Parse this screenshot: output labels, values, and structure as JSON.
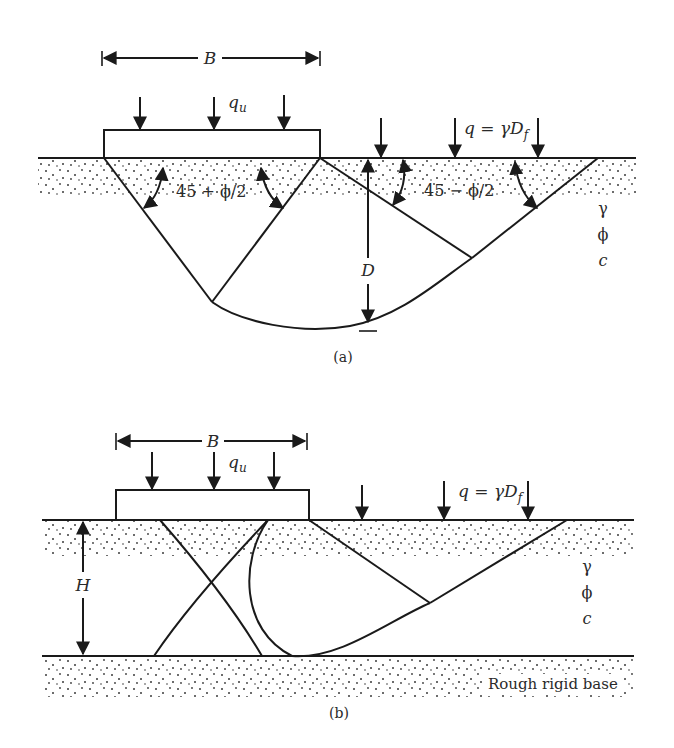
{
  "figure_a": {
    "caption": "(a)",
    "width_label": "B",
    "load_label": "q",
    "load_subscript": "u",
    "surcharge_label_prefix": "q = γD",
    "surcharge_label_subscript": "f",
    "active_angle_label": "45 + ϕ/2",
    "passive_angle_label": "45 − ϕ/2",
    "depth_label": "D",
    "soil_params": [
      "γ",
      "ϕ",
      "c"
    ]
  },
  "figure_b": {
    "caption": "(b)",
    "width_label": "B",
    "load_label": "q",
    "load_subscript": "u",
    "surcharge_label_prefix": "q = γD",
    "surcharge_label_subscript": "f",
    "layer_thickness_label": "H",
    "soil_params": [
      "γ",
      "ϕ",
      "c"
    ],
    "base_label": "Rough rigid base"
  }
}
